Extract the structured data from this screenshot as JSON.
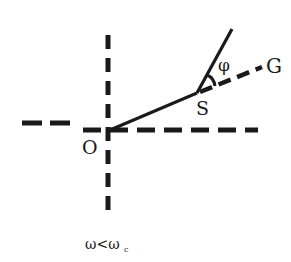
{
  "diagram": {
    "labels": {
      "origin": "O",
      "point_s": "S",
      "point_g": "G",
      "angle": "φ",
      "condition_main": "ω<ω",
      "condition_sub": "c"
    },
    "colors": {
      "line": "#1a1a1a",
      "background": "#ffffff"
    },
    "elements": [
      {
        "type": "dashed-line",
        "name": "vertical-axis",
        "from": [
          108,
          35
        ],
        "to": [
          108,
          218
        ]
      },
      {
        "type": "dashed-line",
        "name": "left-horizontal-axis",
        "from": [
          22,
          123
        ],
        "to": [
          70,
          123
        ]
      },
      {
        "type": "dashed-line",
        "name": "right-horizontal-axis",
        "from": [
          83,
          130
        ],
        "to": [
          258,
          130
        ]
      },
      {
        "type": "solid-line",
        "name": "segment-OS",
        "from": [
          110,
          130
        ],
        "to": [
          197,
          93
        ]
      },
      {
        "type": "solid-line",
        "name": "segment-S-upper",
        "from": [
          197,
          93
        ],
        "to": [
          232,
          29
        ]
      },
      {
        "type": "dashed-line",
        "name": "segment-SG",
        "from": [
          197,
          93
        ],
        "to": [
          262,
          67
        ]
      },
      {
        "type": "angle-arc",
        "name": "angle-phi",
        "vertex": [
          197,
          93
        ]
      }
    ]
  }
}
